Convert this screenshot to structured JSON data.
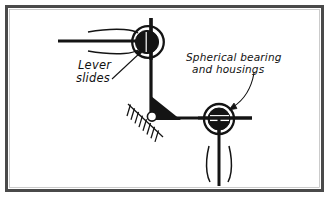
{
  "figure": {
    "canvas": {
      "width": 329,
      "height": 197
    },
    "colors": {
      "ink": "#1a1a1a",
      "border": "#4a4a4a",
      "border_inner": "#8d8d8d",
      "paper": "#ffffff",
      "fill_black": "#111111",
      "pin_white": "#ffffff"
    },
    "border": {
      "outer_stroke": "#4a4a4a",
      "outer_width": 3,
      "inset": 6
    }
  },
  "annotations": [
    {
      "id": "lever-slides",
      "lines": [
        "Lever",
        "slides"
      ],
      "line1": "Lever",
      "line2": "slides",
      "x": 78,
      "y": 69,
      "font_size": 11,
      "leader": {
        "type": "straight",
        "from_x": 110,
        "from_y": 78,
        "to_x": 142,
        "to_y": 50,
        "arrow": true
      }
    },
    {
      "id": "spherical-bearing-and-housings",
      "lines": [
        "Spherical bearing",
        "and housings"
      ],
      "line1": "Spherical bearing",
      "line2": "and housings",
      "x": 186,
      "y": 60,
      "font_size": 10.5,
      "leader": {
        "type": "curved",
        "from_x": 252,
        "from_y": 73,
        "ctrl_x": 247,
        "ctrl_y": 100,
        "to_x": 228,
        "to_y": 110,
        "arrow": true
      }
    }
  ],
  "parts": {
    "top_bearing": {
      "name": "spherical bearing upper",
      "cx": 148,
      "cy": 42,
      "housing_r": 16,
      "ball_r": 11.5,
      "housing_stroke_width": 2.2,
      "shaft_orientation": "vertical"
    },
    "lower_bearing": {
      "name": "spherical bearing lower",
      "cx": 219,
      "cy": 119,
      "housing_r": 15,
      "ball_r": 11,
      "housing_stroke_width": 2.2,
      "shaft_orientation": "horizontal"
    },
    "pivot": {
      "name": "fixed pin pivot with ground hatching",
      "cx": 153,
      "cy": 117,
      "pin_r": 4.2,
      "gusset": "triangular black fillet",
      "ground_angle_deg": 45,
      "hatch_count": 9
    },
    "lever_horizontal_left": {
      "name": "sliding lever bar",
      "x1": 58,
      "y1": 41,
      "x2": 148,
      "y2": 41,
      "stroke_width": 3.2,
      "break_marks": 2
    },
    "member_vertical": {
      "name": "vertical lever arm",
      "x1": 151,
      "y1": 18,
      "x2": 151,
      "y2": 116,
      "stroke_width": 3.2
    },
    "member_horizontal_right": {
      "name": "horizontal lever arm",
      "x1": 153,
      "y1": 118,
      "x2": 250,
      "y2": 118,
      "stroke_width": 3.2
    },
    "rod_vertical_lower": {
      "name": "lower connecting rod",
      "x1": 219,
      "y1": 130,
      "x2": 219,
      "y2": 185,
      "stroke_width": 3.0,
      "break_marks": 2
    }
  },
  "break_marks": {
    "upper_lever_top": "curved bracket above sliding bar",
    "upper_lever_bottom": "curved bracket below sliding bar",
    "lower_rod_left": "curved bracket left of rod",
    "lower_rod_right": "curved bracket right of rod"
  }
}
